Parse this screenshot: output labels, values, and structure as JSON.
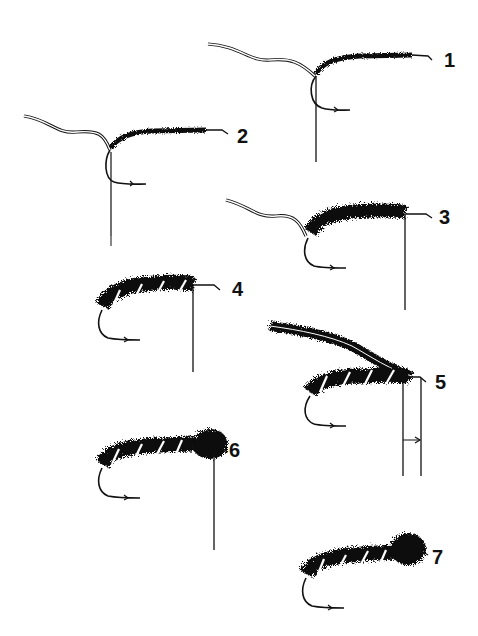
{
  "diagram": {
    "type": "fly-tying-step-sequence",
    "background": "#ffffff",
    "ink_color": "#111111",
    "steps": [
      {
        "number": "1",
        "label_x": 444,
        "label_y": 52,
        "content": "hook with thread base wrapped along shank, tail wire tied in"
      },
      {
        "number": "2",
        "label_x": 237,
        "label_y": 128,
        "content": "dubbing loop hanging from hook bend, thread wrapped forward"
      },
      {
        "number": "3",
        "label_x": 441,
        "label_y": 209,
        "content": "dubbed body wound along shank"
      },
      {
        "number": "4",
        "label_x": 234,
        "label_y": 281,
        "content": "wire ribbing wound over body"
      },
      {
        "number": "5",
        "label_x": 437,
        "label_y": 373,
        "content": "hackle/dubbing strand tied in at front, gap marker below"
      },
      {
        "number": "6",
        "label_x": 230,
        "label_y": 441,
        "content": "dense head/thorax wound at front"
      },
      {
        "number": "7",
        "label_x": 432,
        "label_y": 549,
        "content": "finished fly"
      }
    ]
  }
}
